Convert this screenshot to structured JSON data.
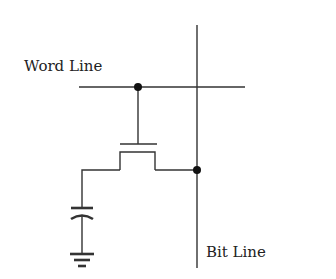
{
  "diagram": {
    "labels": {
      "word_line": "Word Line",
      "bit_line": "Bit Line"
    },
    "components": [
      "word-line",
      "bit-line",
      "access-transistor",
      "storage-capacitor",
      "ground"
    ],
    "colors": {
      "line": "#333333",
      "node": "#111111",
      "background": "#ffffff"
    }
  }
}
